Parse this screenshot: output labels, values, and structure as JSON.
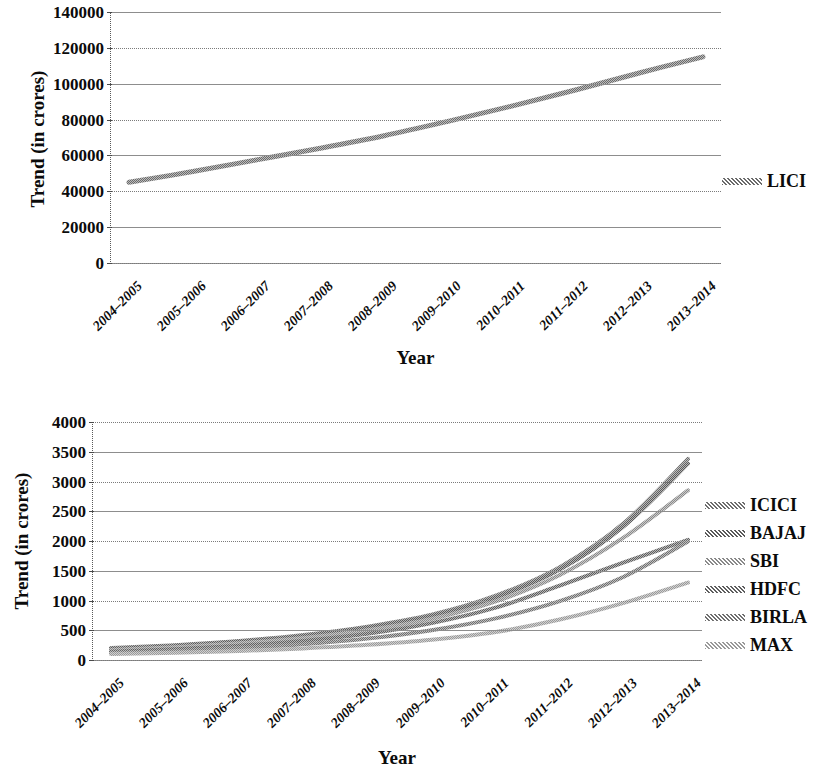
{
  "chart_data": [
    {
      "type": "line",
      "id": "lici-trend",
      "title": "",
      "xlabel": "Year",
      "ylabel": "Trend (in crores)",
      "grid": true,
      "legend_position": "right",
      "ylim": [
        0,
        140000
      ],
      "yticks": [
        "0",
        "20000",
        "40000",
        "60000",
        "80000",
        "100000",
        "120000",
        "140000"
      ],
      "ytick_values": [
        0,
        20000,
        40000,
        60000,
        80000,
        100000,
        120000,
        140000
      ],
      "categories": [
        "2004-2005",
        "2005-2006",
        "2006-2007",
        "2007-2008",
        "2008-2009",
        "2009-2010",
        "2010-2011",
        "2011-2012",
        "2012-2013",
        "2013-2014"
      ],
      "series": [
        {
          "name": "LICI",
          "color": "#6b6b6b",
          "values": [
            45000,
            51000,
            57500,
            64000,
            71000,
            79000,
            87500,
            96500,
            106000,
            115000
          ]
        }
      ]
    },
    {
      "type": "line",
      "id": "private-insurers-trend",
      "title": "",
      "xlabel": "Year",
      "ylabel": "Trend (in crores)",
      "grid": true,
      "legend_position": "right",
      "ylim": [
        0,
        4000
      ],
      "yticks": [
        "0",
        "500",
        "1000",
        "1500",
        "2000",
        "2500",
        "3000",
        "3500",
        "4000"
      ],
      "ytick_values": [
        0,
        500,
        1000,
        1500,
        2000,
        2500,
        3000,
        3500,
        4000
      ],
      "categories": [
        "2004-2005",
        "2005-2006",
        "2006-2007",
        "2007-2008",
        "2008-2009",
        "2009-2010",
        "2010-2011",
        "2011-2012",
        "2012-2013",
        "2013-2014"
      ],
      "series": [
        {
          "name": "ICICI",
          "color": "#6e6e6e",
          "values": [
            200,
            250,
            320,
            420,
            560,
            760,
            1080,
            1560,
            2300,
            3380
          ]
        },
        {
          "name": "BAJAJ",
          "color": "#5a5a5a",
          "values": [
            190,
            240,
            310,
            405,
            545,
            740,
            1050,
            1520,
            2250,
            3300
          ]
        },
        {
          "name": "SBI",
          "color": "#8a8a8a",
          "values": [
            170,
            215,
            280,
            370,
            500,
            690,
            985,
            1430,
            2060,
            2850
          ]
        },
        {
          "name": "HDFC",
          "color": "#5f5f5f",
          "values": [
            140,
            180,
            240,
            320,
            440,
            620,
            880,
            1250,
            1640,
            2020
          ]
        },
        {
          "name": "BIRLA",
          "color": "#707070",
          "values": [
            120,
            150,
            200,
            265,
            360,
            500,
            700,
            990,
            1400,
            1990
          ]
        },
        {
          "name": "MAX",
          "color": "#9a9a9a",
          "values": [
            100,
            120,
            150,
            195,
            255,
            340,
            470,
            680,
            960,
            1300
          ]
        }
      ]
    }
  ],
  "top_chart": {
    "ylabel": "Trend (in crores)",
    "xlabel": "Year",
    "yticks": [
      "140000",
      "120000",
      "100000",
      "80000",
      "60000",
      "40000",
      "20000",
      "0"
    ],
    "xticks": [
      "2004-2005",
      "2005-2006",
      "2006-2007",
      "2007-2008",
      "2008-2009",
      "2009-2010",
      "2010-2011",
      "2011-2012",
      "2012-2013",
      "2013-2014"
    ],
    "legend": [
      {
        "label": "LICI",
        "color": "#6b6b6b"
      }
    ]
  },
  "bottom_chart": {
    "ylabel": "Trend (in crores)",
    "xlabel": "Year",
    "yticks": [
      "4000",
      "3500",
      "3000",
      "2500",
      "2000",
      "1500",
      "1000",
      "500",
      "0"
    ],
    "xticks": [
      "2004-2005",
      "2005-2006",
      "2006-2007",
      "2007-2008",
      "2008-2009",
      "2009-2010",
      "2010-2011",
      "2011-2012",
      "2012-2013",
      "2013-2014"
    ],
    "legend": [
      {
        "label": "ICICI",
        "color": "#6e6e6e"
      },
      {
        "label": "BAJAJ",
        "color": "#5a5a5a"
      },
      {
        "label": "SBI",
        "color": "#8a8a8a"
      },
      {
        "label": "HDFC",
        "color": "#5f5f5f"
      },
      {
        "label": "BIRLA",
        "color": "#707070"
      },
      {
        "label": "MAX",
        "color": "#9a9a9a"
      }
    ]
  }
}
